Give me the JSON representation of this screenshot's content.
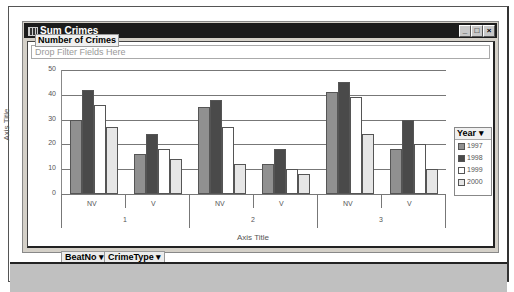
{
  "window": {
    "title": "Sum Crimes",
    "buttons": {
      "minimize": "_",
      "maximize": "□",
      "close": "×"
    }
  },
  "filter_zone": {
    "placeholder": "Drop Filter Fields Here"
  },
  "chart": {
    "title": "Number of Crimes",
    "y_axis_title": "Axis Title",
    "x_axis_title": "Axis Title",
    "y_ticks": [
      "50",
      "40",
      "30",
      "20",
      "10",
      "0"
    ],
    "groups": [
      {
        "label": "1",
        "categories": [
          "NV",
          "V"
        ]
      },
      {
        "label": "2",
        "categories": [
          "NV",
          "V"
        ]
      },
      {
        "label": "3",
        "categories": [
          "NV",
          "V"
        ]
      }
    ]
  },
  "legend": {
    "header": "Year ▾",
    "items": [
      {
        "label": "1997",
        "color": "#909090"
      },
      {
        "label": "1998",
        "color": "#4a4a4a"
      },
      {
        "label": "1999",
        "color": "#ffffff"
      },
      {
        "label": "2000",
        "color": "#e6e6e6"
      }
    ]
  },
  "field_buttons": {
    "beat": "BeatNo ▾",
    "crime_type": "CrimeType ▾"
  },
  "chart_data": {
    "type": "bar",
    "title": "Number of Crimes",
    "xlabel": "Axis Title",
    "ylabel": "Axis Title",
    "ylim": [
      0,
      50
    ],
    "categories": [
      "1 NV",
      "1 V",
      "2 NV",
      "2 V",
      "3 NV",
      "3 V"
    ],
    "series": [
      {
        "name": "1997",
        "values": [
          30,
          16,
          35,
          12,
          41,
          18
        ]
      },
      {
        "name": "1998",
        "values": [
          42,
          24,
          38,
          18,
          45,
          30
        ]
      },
      {
        "name": "1999",
        "values": [
          36,
          18,
          27,
          10,
          39,
          20
        ]
      },
      {
        "name": "2000",
        "values": [
          27,
          14,
          12,
          8,
          24,
          10
        ]
      }
    ],
    "grid": true,
    "legend_position": "right"
  }
}
